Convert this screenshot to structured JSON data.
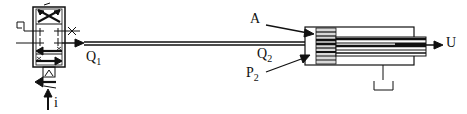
{
  "diagram": {
    "type": "hydraulic servo valve and cylinder schematic",
    "labels": {
      "q1": {
        "main": "Q",
        "sub": "1"
      },
      "q2": {
        "main": "Q",
        "sub": "2"
      },
      "p2": {
        "main": "P",
        "sub": "2"
      },
      "a": "A",
      "u": "U",
      "i": "i"
    },
    "components": [
      "servo-valve",
      "supply-line",
      "hydraulic-cylinder",
      "piston",
      "piston-rod",
      "tank-return"
    ],
    "colors": {
      "stroke": "#111111",
      "background": "#ffffff",
      "shading": "#888888"
    }
  }
}
